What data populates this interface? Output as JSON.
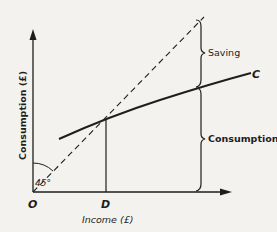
{
  "diagram": {
    "axes": {
      "x_label": "Income (£)",
      "y_label": "Consumption (£)",
      "origin_label": "O"
    },
    "angle_label": "45°",
    "curve_label": "C",
    "point_label": "D",
    "braces": [
      {
        "label": "Saving"
      },
      {
        "label": "Consumption"
      }
    ],
    "colors": {
      "ink": "#1e1e1e",
      "paper": "#f3f2ee"
    }
  }
}
